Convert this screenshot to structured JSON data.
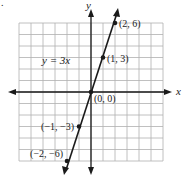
{
  "marker": ".",
  "axes": {
    "x_label": "x",
    "y_label": "y"
  },
  "equation_label": "y = 3x",
  "points": [
    {
      "x": 2,
      "y": 6,
      "label": "(2, 6)"
    },
    {
      "x": 1,
      "y": 3,
      "label": "(1, 3)"
    },
    {
      "x": 0,
      "y": 0,
      "label": "(0, 0)"
    },
    {
      "x": -1,
      "y": -3,
      "label": "(−1, −3)"
    },
    {
      "x": -2,
      "y": -6,
      "label": "(−2, −6)"
    }
  ],
  "colors": {
    "grid": "#b0b0b0",
    "axis": "#1a1a1a",
    "line": "#1a1a1a"
  },
  "chart_data": {
    "type": "line",
    "title": "",
    "equation": "y = 3x",
    "xlabel": "x",
    "ylabel": "y",
    "xlim": [
      -6,
      6
    ],
    "ylim": [
      -6,
      6
    ],
    "grid": true,
    "series": [
      {
        "name": "y = 3x",
        "x": [
          -2,
          -1,
          0,
          1,
          2
        ],
        "y": [
          -6,
          -3,
          0,
          3,
          6
        ]
      }
    ],
    "annotations": [
      "(2, 6)",
      "(1, 3)",
      "(0, 0)",
      "(−1, −3)",
      "(−2, −6)",
      "y = 3x"
    ]
  }
}
